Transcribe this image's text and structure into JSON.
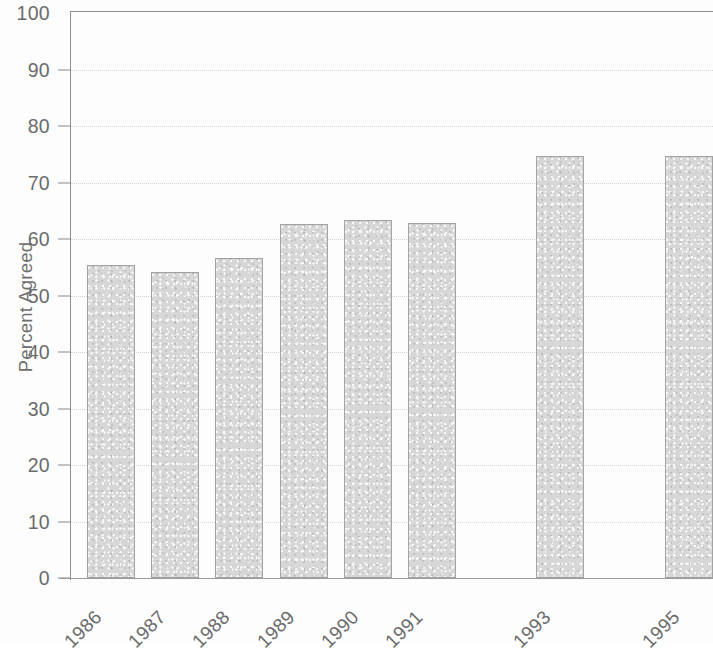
{
  "chart_data": {
    "type": "bar",
    "title": "",
    "subtitle": "",
    "xlabel": "",
    "ylabel": "Percent Agreed",
    "categories": [
      "1986",
      "1987",
      "1988",
      "1989",
      "1990",
      "1991",
      "1992",
      "1993",
      "1994",
      "1995"
    ],
    "values": [
      55.4,
      54.2,
      56.6,
      62.7,
      63.3,
      62.8,
      null,
      74.7,
      null,
      74.7
    ],
    "ylim": [
      0,
      100
    ],
    "xlim_note": "categorical, slots for 1992 and 1994 present but empty (no data)",
    "yticks": [
      0,
      10,
      20,
      30,
      40,
      50,
      60,
      70,
      80,
      90,
      100
    ],
    "ytick_labels": [
      "0",
      "10",
      "20",
      "30",
      "40",
      "50",
      "60",
      "70",
      "80",
      "90",
      "100"
    ],
    "grid": "horizontal dotted gridlines at each y tick",
    "legend": "none",
    "legend_position": "none",
    "annotations": [],
    "series": [
      {
        "name": "Percent Agreed",
        "values": [
          55.4,
          54.2,
          56.6,
          62.7,
          63.3,
          62.8,
          null,
          74.7,
          null,
          74.7
        ]
      }
    ],
    "bar_fill_color": "#d7d7d7",
    "bar_border_color": "#a3a3a3",
    "axis_color": "#8e8e8e",
    "gridline_color": "#d9d9d9",
    "text_color": "#6b6b6b",
    "background_color": "#ffffff"
  },
  "axis": {
    "y_title": "Percent Agreed"
  }
}
